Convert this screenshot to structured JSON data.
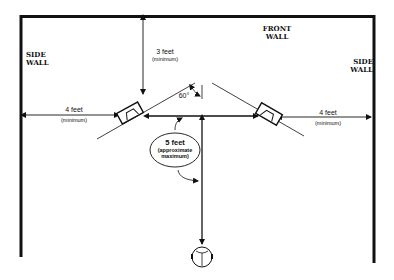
{
  "walls": {
    "front": {
      "line1": "FRONT",
      "line2": "WALL"
    },
    "side_left": {
      "line1": "SIDE",
      "line2": "WALL"
    },
    "side_right": {
      "line1": "SIDE",
      "line2": "WALL"
    }
  },
  "dimensions": {
    "front_clearance": {
      "value": "3 feet",
      "note": "(minimum)"
    },
    "left_side_clearance": {
      "value": "4 feet",
      "note": "(minimum)"
    },
    "right_side_clearance": {
      "value": "4 feet",
      "note": "(minimum)"
    },
    "speaker_spacing": {
      "value": "5 feet",
      "note_line1": "(approximate",
      "note_line2": "maximum)"
    },
    "toe_in_angle": "60°"
  },
  "icons": {
    "left_speaker": "speaker-icon",
    "right_speaker": "speaker-icon",
    "listener": "listener-head-icon"
  },
  "colors": {
    "ink": "#111111",
    "background": "#ffffff"
  }
}
